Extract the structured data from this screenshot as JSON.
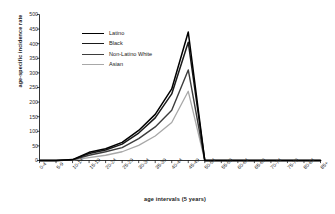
{
  "chart_data": {
    "type": "line",
    "title": "",
    "xlabel": "age intervals (5 years)",
    "ylabel": "age-specific incidence rate",
    "categories": [
      "0-4",
      "5-9",
      "10-14",
      "15-19",
      "20-24",
      "25-29",
      "30-34",
      "35-39",
      "40-44",
      "45-49",
      "50-54",
      "55-59",
      "60-64",
      "65-69",
      "70-74",
      "75-79",
      "80-84",
      "85+"
    ],
    "ylim": [
      0,
      500
    ],
    "yticks": [
      0,
      50,
      100,
      150,
      200,
      250,
      300,
      350,
      400,
      450,
      500
    ],
    "grid": false,
    "legend_position": "upper-left-inside",
    "series": [
      {
        "name": "Latino",
        "color": "#000000",
        "width": 1.5,
        "values": [
          0,
          0,
          3,
          28,
          40,
          62,
          103,
          158,
          245,
          440,
          0,
          0,
          0,
          0,
          0,
          0,
          0,
          0
        ]
      },
      {
        "name": "Black",
        "color": "#1a1a1a",
        "width": 1.5,
        "values": [
          0,
          0,
          2,
          24,
          36,
          56,
          94,
          146,
          228,
          405,
          0,
          0,
          0,
          0,
          0,
          0,
          0,
          0
        ]
      },
      {
        "name": "Non-Latino White",
        "color": "#3d3d3d",
        "width": 1.4,
        "values": [
          0,
          0,
          2,
          18,
          30,
          44,
          75,
          115,
          172,
          310,
          0,
          0,
          0,
          0,
          0,
          0,
          0,
          0
        ]
      },
      {
        "name": "Asian",
        "color": "#a8a8a8",
        "width": 1.3,
        "values": [
          0,
          0,
          1,
          10,
          18,
          30,
          52,
          84,
          130,
          237,
          0,
          0,
          0,
          0,
          0,
          0,
          0,
          0
        ]
      }
    ]
  }
}
